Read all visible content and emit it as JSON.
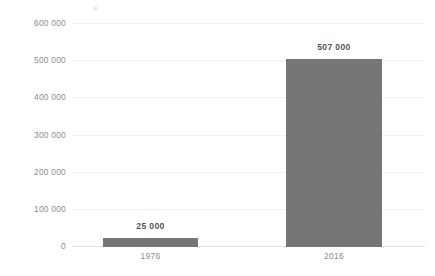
{
  "chart_data": {
    "type": "bar",
    "title": "",
    "subtitle": "",
    "xlabel": "",
    "ylabel": "",
    "categories": [
      "1976",
      "2016"
    ],
    "values": [
      25000,
      507000
    ],
    "data_labels": [
      "25 000",
      "507 000"
    ],
    "series": [
      {
        "name": "",
        "values": [
          25000,
          507000
        ]
      }
    ],
    "ylim": [
      0,
      600000
    ],
    "yticks": [
      0,
      100000,
      200000,
      300000,
      400000,
      500000,
      600000
    ],
    "ytick_labels": [
      "0",
      "100 000",
      "200 000",
      "300 000",
      "400 000",
      "500 000",
      "600 000"
    ],
    "grid": true,
    "grid_axis": "y",
    "legend": false,
    "legend_position": "none",
    "bar_color": "#767676",
    "gridline_color": "#f0f0f0",
    "axis_line_color": "#e4e4e4",
    "tick_label_color": "#8c8c8c",
    "value_label_color": "#545454",
    "background_color": "#ffffff"
  },
  "axis": {
    "y": {
      "t600": "600 000",
      "t500": "500 000",
      "t400": "400 000",
      "t300": "300 000",
      "t200": "200 000",
      "t100": "100 000",
      "t0": "0"
    },
    "x": {
      "cat1": "1976",
      "cat2": "2016"
    }
  },
  "bars": {
    "bar1": {
      "category": "1976",
      "value": 25000,
      "label": "25 000"
    },
    "bar2": {
      "category": "2016",
      "value": 507000,
      "label": "507 000"
    }
  }
}
